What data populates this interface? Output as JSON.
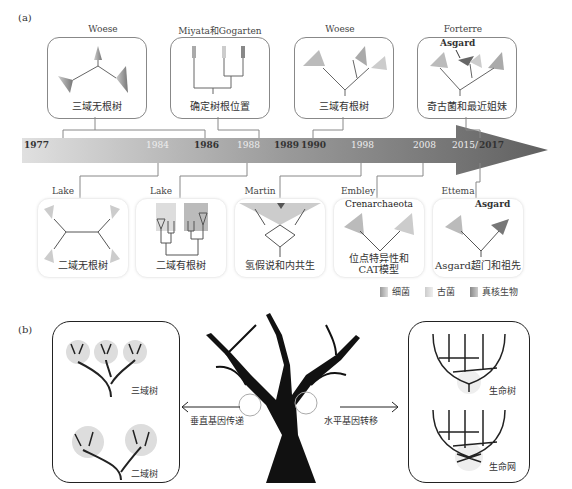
{
  "panel_a": {
    "label": "(a)",
    "timeline": {
      "years": [
        {
          "text": "1977",
          "x": 24,
          "style": "dark"
        },
        {
          "text": "1984",
          "x": 146,
          "style": "light"
        },
        {
          "text": "1986",
          "x": 196,
          "style": "dark"
        },
        {
          "text": "1988",
          "x": 240,
          "style": "light"
        },
        {
          "text": "1989",
          "x": 280,
          "style": "dark"
        },
        {
          "text": "1990",
          "x": 303,
          "style": "dark"
        },
        {
          "text": "1998",
          "x": 356,
          "style": "light"
        },
        {
          "text": "2008",
          "x": 415,
          "style": "light"
        },
        {
          "text": "2015/",
          "x": 461,
          "style": "light"
        },
        {
          "text": "2017",
          "x": 483,
          "style": "dark"
        }
      ]
    },
    "top_items": [
      {
        "author": "Woese",
        "caption": "三域无根树"
      },
      {
        "author": "Miyata和Gogarten",
        "caption": "确定树根位置"
      },
      {
        "author": "Woese",
        "caption": "三域有根树"
      },
      {
        "author": "Forterre",
        "caption": "奇古菌和最近姐妹",
        "annotation": "Asgard"
      }
    ],
    "bottom_items": [
      {
        "author": "Lake",
        "caption": "二域无根树"
      },
      {
        "author": "Lake",
        "caption": "二域有根树"
      },
      {
        "author": "Martin",
        "caption": "氢假说和内共生"
      },
      {
        "author": "Embley",
        "caption_line1": "位点特异性和",
        "caption_line2": "CAT模型",
        "annotation": "Crenarchaeota"
      },
      {
        "author": "Ettema",
        "caption": "Asgard超门和祖先",
        "annotation": "Asgard"
      }
    ],
    "legend": [
      {
        "label": "细菌",
        "color": "#b8b8b8"
      },
      {
        "label": "古菌",
        "color": "#d8d8d8"
      },
      {
        "label": "真核生物",
        "color": "#a8a8a8"
      }
    ]
  },
  "panel_b": {
    "label": "(b)",
    "left_box": {
      "upper_label": "三域树",
      "lower_label": "二域树"
    },
    "left_arrow_label": "垂直基因传递",
    "right_arrow_label": "水平基因转移",
    "right_box": {
      "upper_label": "生命树",
      "lower_label": "生命网"
    }
  },
  "colors": {
    "arrow_light": "#d8d8d8",
    "arrow_dark": "#6a6a6a",
    "tree": "#111111"
  }
}
